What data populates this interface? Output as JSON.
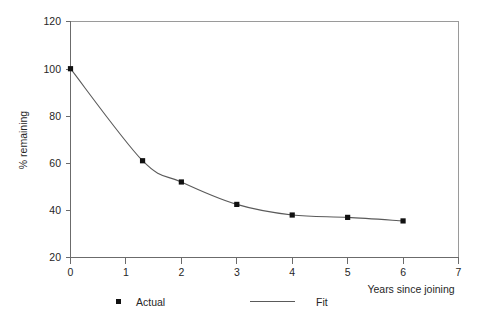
{
  "chart_data": {
    "type": "line",
    "title": "",
    "subtitle": "",
    "xlabel": "Years since joining",
    "ylabel": "% remaining",
    "xlim": [
      0,
      7
    ],
    "ylim": [
      20,
      120
    ],
    "xticks": [
      0,
      1,
      2,
      3,
      4,
      5,
      6,
      7
    ],
    "xtick_labels": [
      "0",
      "1",
      "2",
      "3",
      "4",
      "5",
      "6",
      "7"
    ],
    "yticks": [
      20,
      40,
      60,
      80,
      100,
      120
    ],
    "ytick_labels": [
      "20",
      "40",
      "60",
      "80",
      "100",
      "120"
    ],
    "grid": false,
    "legend_position": "bottom",
    "series": [
      {
        "name": "Actual",
        "marker": "square",
        "style": "markers",
        "color": "#111111",
        "x": [
          0,
          1.3,
          2,
          3,
          4,
          5,
          6
        ],
        "y": [
          100,
          61,
          52,
          42.5,
          38,
          37,
          35.5
        ]
      },
      {
        "name": "Fit",
        "marker": "none",
        "style": "line",
        "color": "#5a5a5a",
        "x": [
          0,
          1.3,
          2,
          3,
          4,
          5,
          6
        ],
        "y": [
          100,
          61,
          52,
          42.5,
          38,
          37,
          35.5
        ]
      }
    ]
  },
  "legend": {
    "entries": [
      {
        "label": "Actual",
        "kind": "marker"
      },
      {
        "label": "Fit",
        "kind": "line"
      }
    ]
  },
  "axes": {
    "y_title": "% remaining",
    "x_title": "Years since joining"
  },
  "colors": {
    "axis": "#6b6b6b",
    "frame": "#9a9a9a",
    "line": "#5a5a5a",
    "marker": "#111111",
    "background": "#ffffff",
    "text": "#262626"
  }
}
